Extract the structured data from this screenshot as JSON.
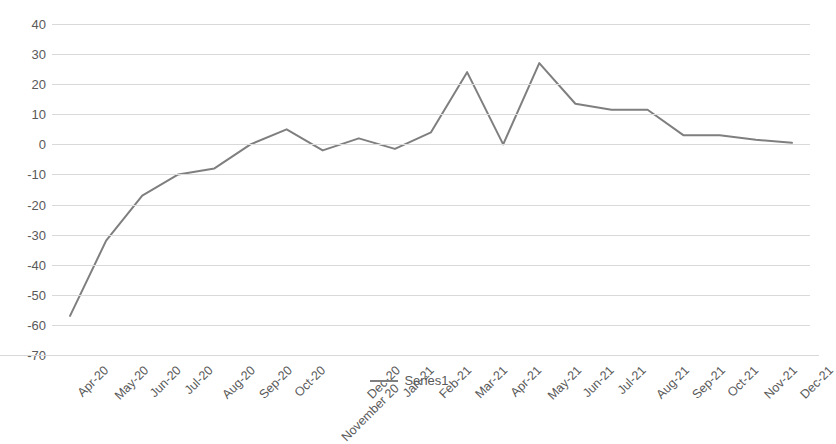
{
  "chart_data": {
    "type": "line",
    "title": "",
    "subtitle": "",
    "xlabel": "",
    "ylabel": "",
    "ylim": [
      -70,
      40
    ],
    "ytick_step": 10,
    "grid": true,
    "legend_position": "bottom",
    "line_color": "#7f7f7f",
    "grid_color": "#d9d9d9",
    "text_color": "#595959",
    "background_color": "#ffffff",
    "yticks": [
      "40",
      "30",
      "20",
      "10",
      "0",
      "-10",
      "-20",
      "-30",
      "-40",
      "-50",
      "-60",
      "-70"
    ],
    "ytick_values": [
      40,
      30,
      20,
      10,
      0,
      -10,
      -20,
      -30,
      -40,
      -50,
      -60,
      -70
    ],
    "categories": [
      "Apr-20",
      "May-20",
      "Jun-20",
      "Jul-20",
      "Aug-20",
      "Sep-20",
      "Oct-20",
      "November 20",
      "Dec-20",
      "Jan-21",
      "Feb-21",
      "Mar-21",
      "Apr-21",
      "May-21",
      "Jun-21",
      "Jul-21",
      "Aug-21",
      "Sep-21",
      "Oct-21",
      "Nov-21",
      "Dec-21"
    ],
    "series": [
      {
        "name": "Series1",
        "values": [
          -57,
          -32,
          -17,
          -10,
          -8,
          0,
          5,
          -2,
          2,
          -1.5,
          4,
          24,
          0,
          27,
          13.5,
          11.5,
          11.5,
          3,
          3,
          1.5,
          0.5
        ]
      }
    ]
  },
  "legend": {
    "entries": [
      {
        "label": "Series1",
        "color": "#7f7f7f"
      }
    ]
  }
}
